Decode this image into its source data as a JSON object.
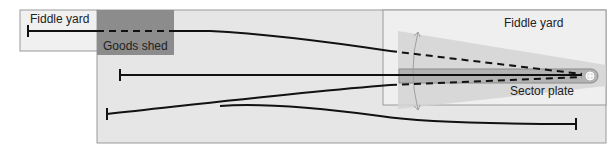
{
  "labels": {
    "fiddle_yard_left": "Fiddle yard",
    "goods_shed": "Goods shed",
    "fiddle_yard_right": "Fiddle yard",
    "sector_plate": "Sector plate"
  },
  "colors": {
    "baseboard": "#e6e6e6",
    "fiddle_yard_left_bg": "#f0f0f0",
    "fiddle_yard_right_bg": "#efefef",
    "goods_shed": "#8c8c8c",
    "sector_sweep": "#d4d4d4",
    "sector_plate": "#b3b3b3",
    "border": "#9a9a9a",
    "track": "#111111"
  }
}
